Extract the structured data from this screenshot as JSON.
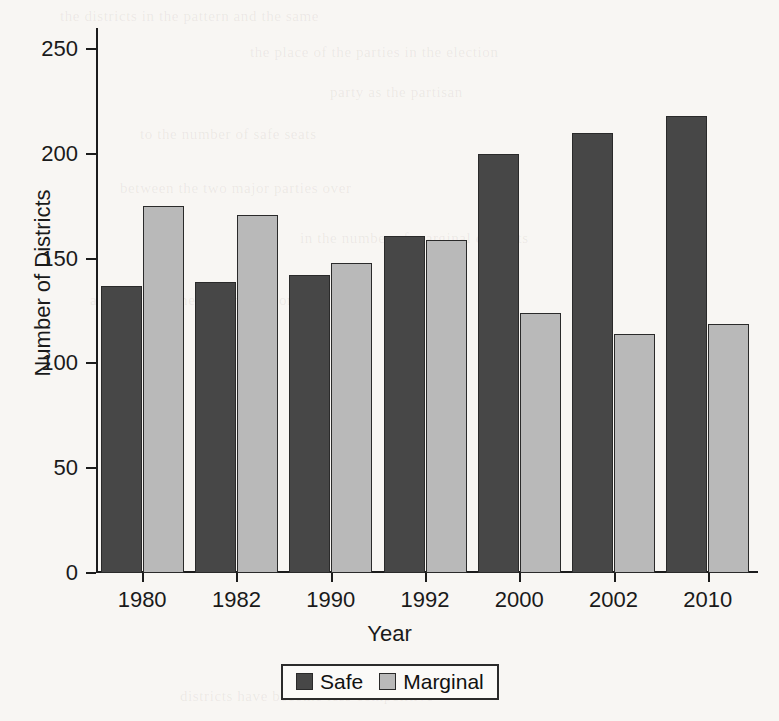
{
  "chart_data": {
    "type": "bar",
    "title": "",
    "xlabel": "Year",
    "ylabel": "Number of Districts",
    "categories": [
      "1980",
      "1982",
      "1990",
      "1992",
      "2000",
      "2002",
      "2010"
    ],
    "series": [
      {
        "name": "Safe",
        "color": "#474747",
        "values": [
          137,
          139,
          142,
          161,
          200,
          210,
          218
        ]
      },
      {
        "name": "Marginal",
        "color": "#b9b9b9",
        "values": [
          175,
          171,
          148,
          159,
          124,
          114,
          119
        ]
      }
    ],
    "ylim": [
      0,
      260
    ],
    "yticks": [
      0,
      50,
      100,
      150,
      200,
      250
    ],
    "ytick_labels": [
      "0",
      "50",
      "100",
      "150",
      "200",
      "250"
    ],
    "grid": false,
    "legend_position": "bottom-center",
    "legend_entries": [
      "Safe",
      "Marginal"
    ]
  },
  "ghost_text": [
    "the districts in the pattern and the same",
    "the place of the parties in the election",
    "party as the partisan",
    "to the number of safe seats",
    "between the two major parties over",
    "in the number of marginal districts",
    "a steady decline in competition",
    "districts have become less competitive"
  ]
}
